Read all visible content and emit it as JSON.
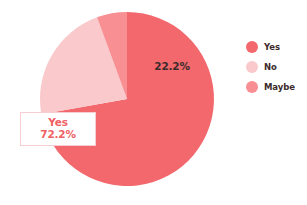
{
  "chart_data": {
    "type": "pie",
    "title": "",
    "categories": [
      "Yes",
      "No",
      "Maybe"
    ],
    "values": [
      72.2,
      22.2,
      5.6
    ],
    "value_labels": [
      "72.2%",
      "22.2%",
      ""
    ],
    "colors": [
      "#f2686c",
      "#f9c9cc",
      "#f78f93"
    ],
    "legend_position": "right",
    "grid": false,
    "start_angle_deg": 0,
    "direction": "clockwise",
    "geometry": {
      "center_x": 127,
      "center_y": 99,
      "radius": 87
    }
  },
  "legend": {
    "items": [
      {
        "label": "Yes",
        "color": "#f2686c"
      },
      {
        "label": "No",
        "color": "#f9c9cc"
      },
      {
        "label": "Maybe",
        "color": "#f78f93"
      }
    ]
  },
  "slice_labels": {
    "no": {
      "text": "22.2%",
      "x": 172,
      "y": 70
    }
  },
  "callout": {
    "category": "Yes",
    "percent": "72.2%",
    "text_color": "#ef5f63",
    "border_color": "#f6ced1",
    "background": "#ffffff"
  }
}
